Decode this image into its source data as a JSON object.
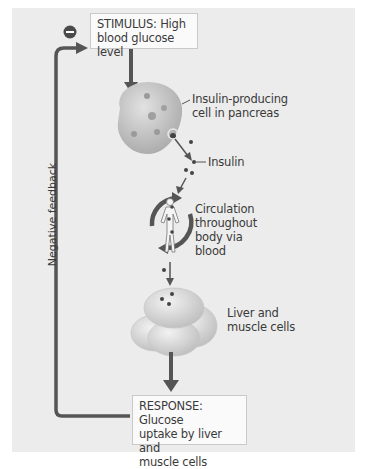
{
  "diagram": {
    "stimulus": {
      "line1": "STIMULUS: High",
      "line2": "blood glucose level"
    },
    "pancreas_label": {
      "line1": "Insulin-producing",
      "line2": "cell in pancreas"
    },
    "insulin_label": "Insulin",
    "circulation_label": {
      "line1": "Circulation",
      "line2": "throughout",
      "line3": "body via",
      "line4": "blood"
    },
    "target_label": {
      "line1": "Liver and",
      "line2": "muscle cells"
    },
    "response": {
      "line1": "RESPONSE: Glucose",
      "line2": "uptake by liver and",
      "line3": "muscle cells"
    },
    "feedback_label": "Negative feedback",
    "feedback_sign": "−",
    "icons": [
      "minus-circle-icon",
      "pancreas-cell-icon",
      "human-body-circulation-icon",
      "liver-muscle-cells-icon",
      "insulin-molecule-icon"
    ],
    "colors": {
      "panel_bg": "#ececec",
      "box_bg": "#fafafa",
      "arrow": "#555555",
      "cell": "#bdbdbd",
      "text": "#3a3a3a"
    }
  }
}
